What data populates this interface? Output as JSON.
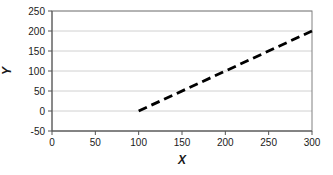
{
  "chart_data": {
    "type": "line",
    "title": "",
    "xlabel": "X",
    "ylabel": "Y",
    "xlim": [
      0,
      300
    ],
    "ylim": [
      -50,
      250
    ],
    "xticks": [
      0,
      50,
      100,
      150,
      200,
      250,
      300
    ],
    "yticks": [
      -50,
      0,
      50,
      100,
      150,
      200,
      250
    ],
    "grid": "horizontal",
    "legend_position": "none",
    "series": [
      {
        "name": "dashed-line",
        "x": [
          100,
          300
        ],
        "y": [
          0,
          200
        ],
        "line_style": "dashed",
        "dash_pattern": "9 5",
        "stroke_width": 2.8,
        "color": "#000000"
      }
    ],
    "colors": {
      "background": "#ffffff",
      "plot_background": "#ffffff",
      "plot_border": "#808080",
      "gridline": "#d0d0d0",
      "axis": "#555555",
      "tick_label": "#1a1a1a"
    }
  }
}
